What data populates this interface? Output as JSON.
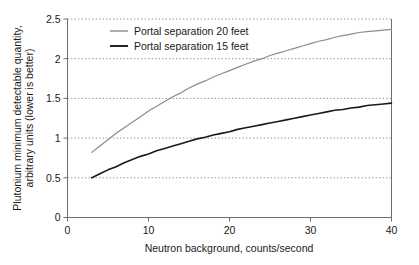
{
  "chart_data": {
    "type": "line",
    "title": "",
    "xlabel": "Neutron background, counts/second",
    "ylabel": "Plutonium minimum detectable quantity, arbitrary units (lower is better)",
    "ylabel_line1": "Plutonium minimum detectable quantity,",
    "ylabel_line2": "arbitrary units (lower is better)",
    "xlim": [
      0,
      40
    ],
    "ylim": [
      0,
      2.5
    ],
    "xticks": [
      0,
      10,
      20,
      30,
      40
    ],
    "xtick_labels": [
      "0",
      "10",
      "20",
      "30",
      "40"
    ],
    "yticks": [
      0,
      0.5,
      1,
      1.5,
      2,
      2.5
    ],
    "ytick_labels": [
      "0",
      "0.5",
      "1",
      "1.5",
      "2",
      "2.5"
    ],
    "grid": "horizontal-dotted",
    "legend_position": "top-center",
    "series": [
      {
        "name": "Portal separation 20 feet",
        "color": "#8c8c8c",
        "x": [
          3,
          4,
          5,
          6,
          7,
          8,
          9,
          10,
          11,
          12,
          13,
          14,
          15,
          16,
          17,
          18,
          19,
          20,
          21,
          22,
          23,
          24,
          25,
          26,
          27,
          28,
          29,
          30,
          31,
          32,
          33,
          34,
          35,
          36,
          37,
          38,
          39,
          40
        ],
        "y": [
          0.82,
          0.9,
          0.98,
          1.06,
          1.13,
          1.2,
          1.27,
          1.34,
          1.4,
          1.46,
          1.52,
          1.57,
          1.63,
          1.68,
          1.72,
          1.77,
          1.81,
          1.85,
          1.89,
          1.93,
          1.97,
          2.0,
          2.04,
          2.07,
          2.1,
          2.13,
          2.16,
          2.19,
          2.22,
          2.24,
          2.27,
          2.29,
          2.31,
          2.33,
          2.34,
          2.35,
          2.36,
          2.37
        ]
      },
      {
        "name": "Portal separation 15 feet",
        "color": "#1a1a1a",
        "x": [
          3,
          4,
          5,
          6,
          7,
          8,
          9,
          10,
          11,
          12,
          13,
          14,
          15,
          16,
          17,
          18,
          19,
          20,
          21,
          22,
          23,
          24,
          25,
          26,
          27,
          28,
          29,
          30,
          31,
          32,
          33,
          34,
          35,
          36,
          37,
          38,
          39,
          40
        ],
        "y": [
          0.5,
          0.55,
          0.6,
          0.64,
          0.69,
          0.73,
          0.77,
          0.8,
          0.84,
          0.87,
          0.9,
          0.93,
          0.96,
          0.99,
          1.01,
          1.04,
          1.06,
          1.08,
          1.11,
          1.13,
          1.15,
          1.17,
          1.19,
          1.21,
          1.23,
          1.25,
          1.27,
          1.29,
          1.31,
          1.33,
          1.35,
          1.36,
          1.38,
          1.39,
          1.41,
          1.42,
          1.43,
          1.44
        ]
      }
    ]
  },
  "legend": {
    "items": [
      {
        "label": "Portal separation 20 feet",
        "color": "#8c8c8c"
      },
      {
        "label": "Portal separation 15 feet",
        "color": "#1a1a1a"
      }
    ]
  },
  "colors": {
    "axis": "#6e6e6e",
    "grid": "#9a9a9a",
    "text": "#1a1a1a",
    "background": "#ffffff",
    "series_20ft": "#8c8c8c",
    "series_15ft": "#1a1a1a"
  }
}
